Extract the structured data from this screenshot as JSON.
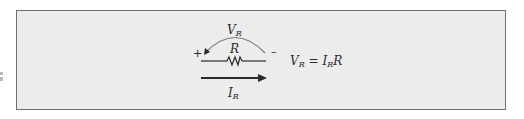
{
  "figure": {
    "labels": {
      "voltage_arc": {
        "main": "V",
        "sub": "R"
      },
      "resistor": "R",
      "current": {
        "main": "I",
        "sub": "R"
      },
      "plus": "+",
      "minus": "–"
    },
    "equation": {
      "lhs_main": "V",
      "lhs_sub": "R",
      "equals": "=",
      "rhs_i_main": "I",
      "rhs_i_sub": "R",
      "rhs_r": "R"
    },
    "colors": {
      "background": "#ececec",
      "border": "#6f6f6f",
      "stroke": "#2a2a2a",
      "arc": "#7a7a7a"
    }
  }
}
